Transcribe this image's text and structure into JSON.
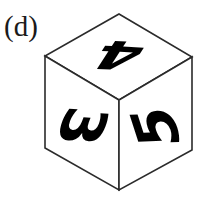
{
  "figure": {
    "panel_label": "(d)",
    "background_color": "#ffffff",
    "edge_color": "#2b2b2b",
    "digit_color": "#000000",
    "label_color": "#1a1a1a"
  },
  "cube": {
    "type": "isometric-cube",
    "vertices": {
      "top_apex": [
        119,
        14
      ],
      "left": [
        45,
        56
      ],
      "right": [
        192,
        57
      ],
      "center": [
        119,
        100
      ],
      "bottom": [
        119,
        190
      ],
      "left_bottom": [
        45,
        148
      ],
      "right_bottom": [
        192,
        150
      ]
    },
    "faces": [
      {
        "name": "top-face",
        "digit": "4",
        "rotation_deg": 183,
        "font_size": 64,
        "center": [
          119,
          55
        ],
        "skew_x_deg": -30,
        "scale_y": 0.62
      },
      {
        "name": "left-face",
        "digit": "3",
        "rotation_deg": 95,
        "font_size": 58,
        "center": [
          82,
          126
        ],
        "skew_y_deg": 16
      },
      {
        "name": "right-face",
        "digit": "5",
        "rotation_deg": -92,
        "font_size": 58,
        "center": [
          156,
          127
        ],
        "skew_y_deg": -16
      }
    ]
  }
}
